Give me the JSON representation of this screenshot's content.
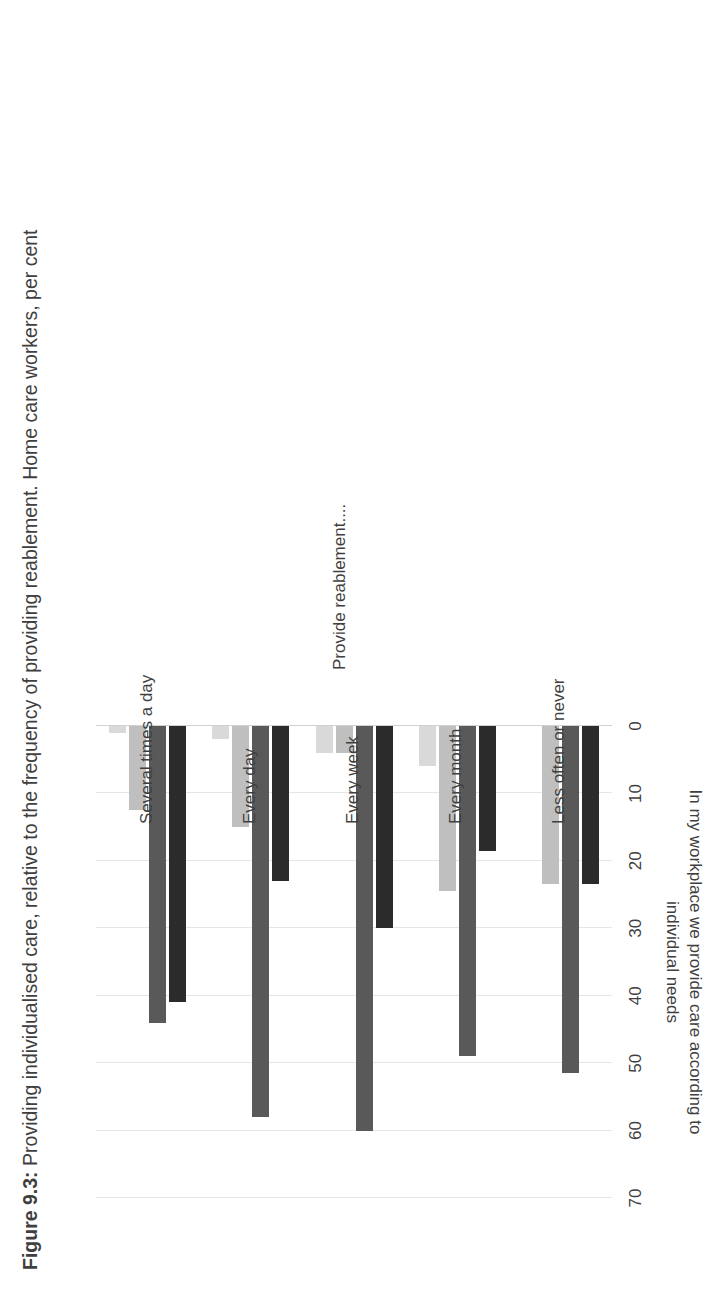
{
  "figure": {
    "number": "Figure 9.3:",
    "caption": "Providing individualised care, relative to the frequency of providing reablement. Home care workers, per cent"
  },
  "axes": {
    "value_axis_title_line1": "In my workplace we provide care according to",
    "value_axis_title_line2": "individual needs",
    "category_axis_title": "Provide reablement....",
    "tick_labels": [
      "0",
      "10",
      "20",
      "30",
      "40",
      "50",
      "60",
      "70"
    ]
  },
  "colors": {
    "series_lightest": "#D9D9D9",
    "series_light": "#BFBFBF",
    "series_medium": "#595959",
    "series_dark": "#2B2B2B",
    "gridline": "#E6E6E6",
    "text": "#3F3F3F",
    "background": "#FFFFFF"
  },
  "chart_data": {
    "type": "bar",
    "orientation": "horizontal",
    "title": "Figure 9.3: Providing individualised care, relative to the frequency of providing reablement. Home care workers, per cent",
    "xlabel": "In my workplace we provide care according to individual needs",
    "ylabel": "Provide reablement....",
    "categories": [
      "Several times a day",
      "Every day",
      "Every week",
      "Every month",
      "Less often or never"
    ],
    "xlim": [
      0,
      70
    ],
    "ticks": [
      0,
      10,
      20,
      30,
      40,
      50,
      60,
      70
    ],
    "grid": true,
    "legend": "none",
    "series": [
      {
        "name": "series-1",
        "color": "#D9D9D9",
        "values": [
          1,
          2,
          4,
          6,
          0
        ]
      },
      {
        "name": "series-2",
        "color": "#BFBFBF",
        "values": [
          12.5,
          15,
          4,
          24.5,
          23.5
        ]
      },
      {
        "name": "series-3",
        "color": "#595959",
        "values": [
          44,
          58,
          60,
          49,
          51.5
        ]
      },
      {
        "name": "series-4",
        "color": "#2B2B2B",
        "values": [
          41,
          23,
          30,
          18.5,
          23.5
        ]
      }
    ]
  }
}
